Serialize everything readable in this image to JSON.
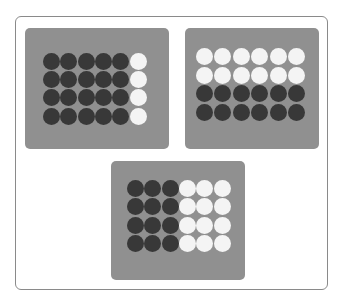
{
  "figure": {
    "colors": {
      "frame_border": "#8a8a8a",
      "panel": "#909090",
      "dark_counter": "#383838",
      "light_counter": "#f4f4f4"
    },
    "panels": [
      {
        "id": "panel-1",
        "rows": 4,
        "cols": 6,
        "split": "columns",
        "dark_count": 20,
        "light_count": 4,
        "layout": [
          "DDDDDL",
          "DDDDDL",
          "DDDDDL",
          "DDDDDL"
        ]
      },
      {
        "id": "panel-2",
        "rows": 4,
        "cols": 6,
        "split": "rows",
        "dark_count": 12,
        "light_count": 12,
        "layout": [
          "LLLLLL",
          "LLLLLL",
          "DDDDDD",
          "DDDDDD"
        ]
      },
      {
        "id": "panel-3",
        "rows": 4,
        "cols": 6,
        "split": "columns",
        "dark_count": 12,
        "light_count": 12,
        "layout": [
          "DDDLLL",
          "DDDLLL",
          "DDDLLL",
          "DDDLLL"
        ]
      }
    ]
  }
}
